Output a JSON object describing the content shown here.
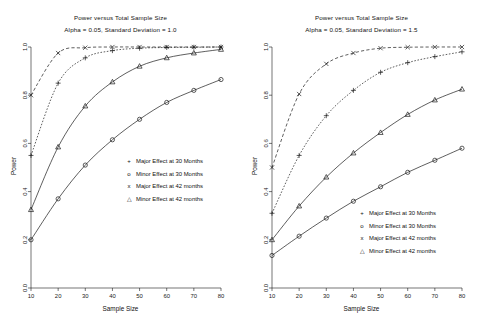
{
  "figure": {
    "background": "#ffffff",
    "foreground": "#1a1a1a",
    "panel_count": 2
  },
  "panels": [
    {
      "id": "left",
      "title": "Power versus Total Sample Size",
      "subtitle": "Alpha = 0.05, Standard Deviation = 1.0",
      "xlabel": "Sample Size",
      "ylabel": "Power"
    },
    {
      "id": "right",
      "title": "Power versus Total Sample Size",
      "subtitle": "Alpha = 0.05, Standard Deviation = 1.5",
      "xlabel": "Sample Size",
      "ylabel": "Power"
    }
  ],
  "legend": {
    "entries": [
      {
        "symbol": "+",
        "label": "Major Effect at 30 Months"
      },
      {
        "symbol": "o",
        "label": "Minor Effect at 30 Months"
      },
      {
        "symbol": "x",
        "label": "Major Effect at 42 months"
      },
      {
        "symbol": "△",
        "label": "Minor Effect at 42 months"
      }
    ]
  },
  "axis": {
    "x_ticks": [
      "10",
      "20",
      "30",
      "40",
      "50",
      "60",
      "70",
      "80"
    ],
    "y_ticks": [
      "0.0",
      "0.2",
      "0.4",
      "0.6",
      "0.8",
      "1.0"
    ]
  },
  "chart_data": [
    {
      "type": "line",
      "title": "Power versus Total Sample Size",
      "subtitle": "Alpha = 0.05, Standard Deviation = 1.0",
      "xlabel": "Sample Size",
      "ylabel": "Power",
      "x": [
        10,
        20,
        30,
        40,
        50,
        60,
        70,
        80
      ],
      "xlim": [
        10,
        80
      ],
      "ylim": [
        0.0,
        1.0
      ],
      "grid": false,
      "legend_position": "center-right",
      "series": [
        {
          "name": "Major Effect at 30 Months",
          "symbol": "+",
          "linestyle": "dotted",
          "values": [
            0.55,
            0.85,
            0.955,
            0.985,
            0.995,
            0.998,
            0.999,
            1.0
          ]
        },
        {
          "name": "Minor Effect at 30 Months",
          "symbol": "o",
          "linestyle": "solid",
          "values": [
            0.2,
            0.37,
            0.51,
            0.615,
            0.7,
            0.77,
            0.82,
            0.865
          ]
        },
        {
          "name": "Major Effect at 42 months",
          "symbol": "x",
          "linestyle": "dashed",
          "values": [
            0.8,
            0.975,
            0.997,
            1.0,
            1.0,
            1.0,
            1.0,
            1.0
          ]
        },
        {
          "name": "Minor Effect at 42 months",
          "symbol": "triangle",
          "linestyle": "solid",
          "values": [
            0.325,
            0.585,
            0.755,
            0.855,
            0.92,
            0.955,
            0.975,
            0.99
          ]
        }
      ]
    },
    {
      "type": "line",
      "title": "Power versus Total Sample Size",
      "subtitle": "Alpha = 0.05, Standard Deviation = 1.5",
      "xlabel": "Sample Size",
      "ylabel": "Power",
      "x": [
        10,
        20,
        30,
        40,
        50,
        60,
        70,
        80
      ],
      "xlim": [
        10,
        80
      ],
      "ylim": [
        0.0,
        1.0
      ],
      "grid": false,
      "legend_position": "lower-right",
      "series": [
        {
          "name": "Major Effect at 30 Months",
          "symbol": "+",
          "linestyle": "dotted",
          "values": [
            0.31,
            0.55,
            0.715,
            0.82,
            0.895,
            0.935,
            0.96,
            0.98
          ]
        },
        {
          "name": "Minor Effect at 30 Months",
          "symbol": "o",
          "linestyle": "solid",
          "values": [
            0.135,
            0.215,
            0.29,
            0.36,
            0.42,
            0.48,
            0.53,
            0.58
          ]
        },
        {
          "name": "Major Effect at 42 months",
          "symbol": "x",
          "linestyle": "dashed",
          "values": [
            0.5,
            0.805,
            0.93,
            0.975,
            0.995,
            0.999,
            1.0,
            1.0
          ]
        },
        {
          "name": "Minor Effect at 42 months",
          "symbol": "triangle",
          "linestyle": "solid",
          "values": [
            0.2,
            0.34,
            0.46,
            0.56,
            0.645,
            0.72,
            0.78,
            0.825
          ]
        }
      ]
    }
  ]
}
